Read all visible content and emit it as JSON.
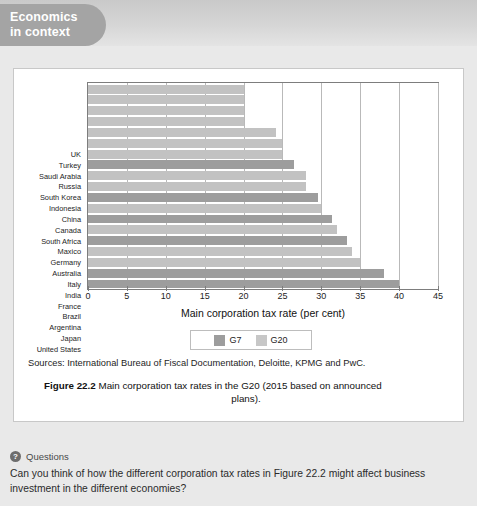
{
  "header": {
    "badge_line1": "Economics",
    "badge_line2": "in context"
  },
  "chart_data": {
    "type": "bar",
    "orientation": "horizontal",
    "title": "",
    "xlabel": "Main corporation tax rate (per cent)",
    "ylabel": "",
    "xlim": [
      0,
      45
    ],
    "xticks": [
      0,
      5,
      10,
      15,
      20,
      25,
      30,
      35,
      40,
      45
    ],
    "grid": true,
    "legend_position": "bottom-center",
    "legend": [
      "G7",
      "G20"
    ],
    "categories": [
      "UK",
      "Turkey",
      "Saudi Arabia",
      "Russia",
      "South Korea",
      "Indonesia",
      "China",
      "Canada",
      "South Africa",
      "Maxico",
      "Germany",
      "Australia",
      "Italy",
      "India",
      "France",
      "Brazil",
      "Argentina",
      "Japan",
      "United States"
    ],
    "values": [
      20,
      20,
      20,
      20,
      24.2,
      25,
      25,
      26.5,
      28,
      28,
      29.6,
      30,
      31.4,
      32,
      33.3,
      34,
      35,
      38,
      40
    ],
    "groups": [
      "G20",
      "G20",
      "G20",
      "G20",
      "G20",
      "G20",
      "G20",
      "G7",
      "G20",
      "G20",
      "G7",
      "G20",
      "G7",
      "G20",
      "G7",
      "G20",
      "G20",
      "G7",
      "G7"
    ],
    "colors": {
      "G7": "#9d9d9d",
      "G20": "#c2c2c2"
    }
  },
  "sources": {
    "text": "Sources: International Bureau of Fiscal Documentation, Deloitte, KPMG and PwC."
  },
  "caption": {
    "label": "Figure 22.2",
    "line1": "Main corporation tax rates in the G20 (2015 based on announced",
    "line2": "plans)."
  },
  "questions": {
    "icon": "question-mark-icon",
    "title": "Questions",
    "text": "Can you think of how the different corporation tax rates in Figure 22.2 might affect business investment in the different economies?"
  }
}
